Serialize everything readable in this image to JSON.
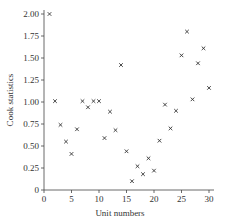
{
  "chart_data": {
    "type": "scatter",
    "title": "",
    "xlabel": "Unit numbers",
    "ylabel": "Cook statistics",
    "xlim": [
      0,
      30
    ],
    "ylim": [
      0,
      2.0
    ],
    "xticks": [
      0,
      5,
      10,
      15,
      20,
      25,
      30
    ],
    "yticks": [
      0,
      0.25,
      0.5,
      0.75,
      1.0,
      1.25,
      1.5,
      1.75,
      2.0
    ],
    "xtick_labels": [
      "0",
      "5",
      "10",
      "15",
      "20",
      "25",
      "30"
    ],
    "ytick_labels": [
      "0",
      "0.25",
      "0.50",
      "0.75",
      "1.00",
      "1.25",
      "1.50",
      "1.75",
      "2.00"
    ],
    "grid": false,
    "legend": null,
    "marker": "×",
    "x": [
      1,
      2,
      3,
      4,
      5,
      6,
      7,
      8,
      9,
      10,
      11,
      12,
      13,
      14,
      15,
      16,
      17,
      18,
      19,
      20,
      21,
      22,
      23,
      24,
      25,
      26,
      27,
      28,
      29,
      30
    ],
    "y": [
      2.0,
      1.01,
      0.74,
      0.55,
      0.41,
      0.69,
      1.01,
      0.94,
      1.01,
      1.01,
      0.59,
      0.89,
      0.68,
      1.42,
      0.44,
      0.1,
      0.27,
      0.18,
      0.36,
      0.22,
      0.56,
      0.97,
      0.7,
      0.9,
      1.53,
      1.8,
      1.03,
      1.44,
      1.61,
      1.16
    ]
  }
}
